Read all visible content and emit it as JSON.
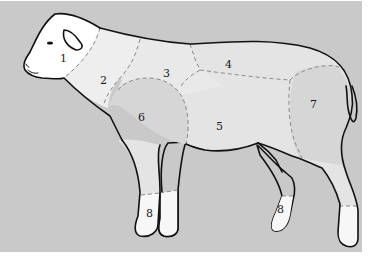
{
  "diagram": {
    "type": "meat cuts diagram",
    "colors": {
      "background": "#c9c9c9",
      "head_cut": "#ffffff",
      "neck_cut": "#eeeeee",
      "body_cut": "#e4e4e4",
      "shoulder_leg_cut": "#d6d6d6",
      "shank_cut": "#f7f7f7",
      "outline": "#111111",
      "divider": "#8a8a8a"
    },
    "cuts": [
      {
        "number": "1",
        "region": "head"
      },
      {
        "number": "2",
        "region": "neck"
      },
      {
        "number": "3",
        "region": "upper shoulder"
      },
      {
        "number": "4",
        "region": "back / loin"
      },
      {
        "number": "5",
        "region": "belly / flank"
      },
      {
        "number": "6",
        "region": "shoulder"
      },
      {
        "number": "7",
        "region": "leg"
      },
      {
        "number": "8",
        "region": "front shank"
      },
      {
        "number": "8",
        "region": "hind shank"
      }
    ]
  }
}
